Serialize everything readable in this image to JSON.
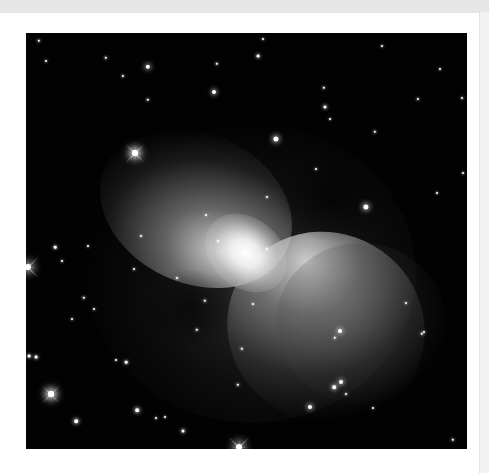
{
  "image": {
    "subject": "bipolar nebula with surrounding star field",
    "palette": {
      "page_background": "#ececec",
      "card_background": "#ffffff",
      "sky": "#020202",
      "nebula_core": "#ffffff",
      "nebula_glow": "#8a8a8a"
    },
    "frame": {
      "left": 26,
      "top": 33,
      "width": 441,
      "height": 416
    },
    "stars": [
      {
        "x": 122,
        "y": 34,
        "r": 2.2
      },
      {
        "x": 80,
        "y": 25,
        "r": 1.2
      },
      {
        "x": 97,
        "y": 43,
        "r": 1.1
      },
      {
        "x": 122,
        "y": 67,
        "r": 1.2
      },
      {
        "x": 188,
        "y": 59,
        "r": 2.0
      },
      {
        "x": 191,
        "y": 31,
        "r": 1.2
      },
      {
        "x": 13,
        "y": 8,
        "r": 1.2
      },
      {
        "x": 20,
        "y": 28,
        "r": 1.0
      },
      {
        "x": 237,
        "y": 6,
        "r": 1.0
      },
      {
        "x": 232,
        "y": 23,
        "r": 1.4
      },
      {
        "x": 298,
        "y": 55,
        "r": 1.2
      },
      {
        "x": 299,
        "y": 74,
        "r": 1.5
      },
      {
        "x": 250,
        "y": 106,
        "r": 2.6
      },
      {
        "x": 392,
        "y": 66,
        "r": 1.1
      },
      {
        "x": 436,
        "y": 65,
        "r": 1.0
      },
      {
        "x": 349,
        "y": 99,
        "r": 1.2
      },
      {
        "x": 356,
        "y": 13,
        "r": 1.0
      },
      {
        "x": 109,
        "y": 120,
        "r": 3.0
      },
      {
        "x": 340,
        "y": 174,
        "r": 2.6
      },
      {
        "x": 241,
        "y": 164,
        "r": 1.0
      },
      {
        "x": 290,
        "y": 136,
        "r": 1.0
      },
      {
        "x": 304,
        "y": 86,
        "r": 1.0
      },
      {
        "x": 180,
        "y": 182,
        "r": 1.0
      },
      {
        "x": 29,
        "y": 214,
        "r": 1.3
      },
      {
        "x": 62,
        "y": 213,
        "r": 1.0
      },
      {
        "x": 115,
        "y": 203,
        "r": 1.0
      },
      {
        "x": 108,
        "y": 236,
        "r": 1.0
      },
      {
        "x": 36,
        "y": 228,
        "r": 1.0
      },
      {
        "x": 68,
        "y": 276,
        "r": 1.0
      },
      {
        "x": 58,
        "y": 265,
        "r": 1.2
      },
      {
        "x": 151,
        "y": 245,
        "r": 1.0
      },
      {
        "x": 171,
        "y": 297,
        "r": 1.2
      },
      {
        "x": 179,
        "y": 268,
        "r": 1.2
      },
      {
        "x": 192,
        "y": 208,
        "r": 1.0
      },
      {
        "x": 3,
        "y": 323,
        "r": 1.4
      },
      {
        "x": 10,
        "y": 324,
        "r": 1.4
      },
      {
        "x": 46,
        "y": 286,
        "r": 1.0
      },
      {
        "x": 90,
        "y": 327,
        "r": 1.0
      },
      {
        "x": 100,
        "y": 329,
        "r": 1.3
      },
      {
        "x": 216,
        "y": 316,
        "r": 1.2
      },
      {
        "x": 25,
        "y": 361,
        "r": 3.0
      },
      {
        "x": 50,
        "y": 388,
        "r": 1.8
      },
      {
        "x": 111,
        "y": 377,
        "r": 1.8
      },
      {
        "x": 130,
        "y": 385,
        "r": 1.0
      },
      {
        "x": 157,
        "y": 398,
        "r": 1.5
      },
      {
        "x": 139,
        "y": 384,
        "r": 1.0
      },
      {
        "x": 212,
        "y": 352,
        "r": 1.2
      },
      {
        "x": 241,
        "y": 216,
        "r": 1.2
      },
      {
        "x": 227,
        "y": 271,
        "r": 1.0
      },
      {
        "x": 309,
        "y": 305,
        "r": 1.2
      },
      {
        "x": 320,
        "y": 361,
        "r": 1.0
      },
      {
        "x": 314,
        "y": 298,
        "r": 2.0
      },
      {
        "x": 315,
        "y": 349,
        "r": 2.0
      },
      {
        "x": 284,
        "y": 374,
        "r": 2.0
      },
      {
        "x": 308,
        "y": 354,
        "r": 1.8
      },
      {
        "x": 347,
        "y": 375,
        "r": 1.0
      },
      {
        "x": 398,
        "y": 299,
        "r": 1.0
      },
      {
        "x": 427,
        "y": 407,
        "r": 1.2
      },
      {
        "x": 414,
        "y": 36,
        "r": 1.0
      },
      {
        "x": 437,
        "y": 140,
        "r": 1.0
      },
      {
        "x": 380,
        "y": 270,
        "r": 1.0
      },
      {
        "x": 396,
        "y": 301,
        "r": 1.2
      },
      {
        "x": 411,
        "y": 160,
        "r": 1.0
      }
    ],
    "flares": [
      {
        "x": 109,
        "y": 120,
        "len": 26
      },
      {
        "x": 25,
        "y": 361,
        "len": 24
      },
      {
        "x": 213,
        "y": 414,
        "len": 30
      },
      {
        "x": 2,
        "y": 234,
        "len": 30
      }
    ]
  }
}
